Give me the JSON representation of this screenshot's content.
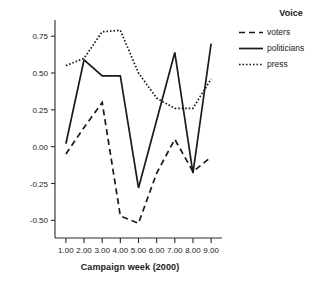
{
  "chart_data": {
    "type": "line",
    "title": "",
    "xlabel": "Campaign week (2000)",
    "ylabel": "",
    "x": [
      1,
      2,
      3,
      4,
      5,
      6,
      7,
      8,
      9
    ],
    "xtick_labels": [
      "1.00",
      "2.00",
      "3.00",
      "4.00",
      "5.00",
      "6.00",
      "7.00",
      "8.00",
      "9.00"
    ],
    "ytick_labels": [
      "0.75",
      "0.50",
      "0.25",
      "0.00",
      "-0.25",
      "-0.50"
    ],
    "ytick_values": [
      0.75,
      0.5,
      0.25,
      0.0,
      -0.25,
      -0.5
    ],
    "xlim": [
      0.4,
      9.6
    ],
    "ylim": [
      -0.62,
      0.86
    ],
    "grid": false,
    "legend_position": "right",
    "legend_title": "Voice",
    "series": [
      {
        "name": "voters",
        "style": "dashed",
        "color": "#1a1a1a",
        "values": [
          -0.05,
          0.13,
          0.3,
          -0.47,
          -0.52,
          -0.18,
          0.05,
          -0.17,
          -0.07
        ]
      },
      {
        "name": "politicians",
        "style": "solid",
        "color": "#1a1a1a",
        "values": [
          0.02,
          0.59,
          0.48,
          0.48,
          -0.28,
          0.18,
          0.64,
          -0.18,
          0.7
        ]
      },
      {
        "name": "press",
        "style": "dotted",
        "color": "#1a1a1a",
        "values": [
          0.55,
          0.6,
          0.78,
          0.79,
          0.5,
          0.33,
          0.26,
          0.26,
          0.46
        ]
      }
    ]
  },
  "legend": {
    "title": "Voice",
    "items": [
      {
        "label": "voters",
        "style": "dashed"
      },
      {
        "label": "politicians",
        "style": "solid"
      },
      {
        "label": "press",
        "style": "dotted"
      }
    ]
  },
  "axes": {
    "x_title": "Campaign week (2000)"
  }
}
